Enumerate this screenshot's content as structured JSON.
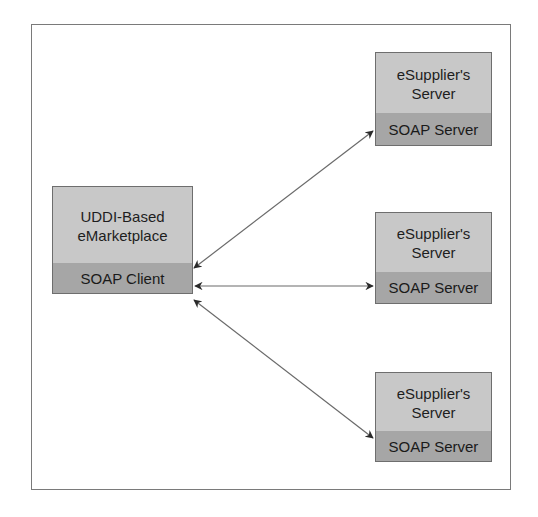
{
  "diagram": {
    "marketplace": {
      "title": "UDDI-Based\neMarketplace",
      "component": "SOAP Client"
    },
    "servers": [
      {
        "title": "eSupplier's\nServer",
        "component": "SOAP Server"
      },
      {
        "title": "eSupplier's\nServer",
        "component": "SOAP Server"
      },
      {
        "title": "eSupplier's\nServer",
        "component": "SOAP Server"
      }
    ],
    "connections": [
      {
        "from": "SOAP Client",
        "to": "SOAP Server (top)",
        "type": "bidirectional"
      },
      {
        "from": "SOAP Client",
        "to": "SOAP Server (middle)",
        "type": "bidirectional"
      },
      {
        "from": "SOAP Client",
        "to": "SOAP Server (bottom)",
        "type": "bidirectional"
      }
    ],
    "colors": {
      "box_top": "#c8c8c8",
      "box_bottom": "#a6a6a6",
      "border": "#6e6e6e",
      "arrow": "#2a2a2a"
    }
  }
}
